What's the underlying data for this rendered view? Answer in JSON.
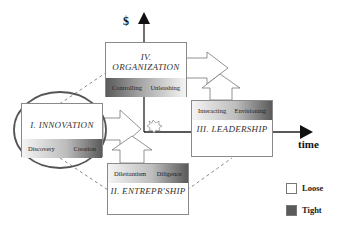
{
  "axes": {
    "y_label": "$",
    "x_label": "time"
  },
  "quadrants": [
    {
      "id": "I",
      "title": "I. INNOVATION",
      "left": "Discovery",
      "right": "Creation"
    },
    {
      "id": "II",
      "title": "II. ENTREPR'SHIP",
      "left": "Dilettantism",
      "right": "Diligence"
    },
    {
      "id": "III",
      "title": "III. LEADERSHIP",
      "left": "Interacting",
      "right": "Envisioning"
    },
    {
      "id": "IV",
      "title": "IV. ORGANIZATION",
      "left": "Controlling",
      "right": "Unleashing"
    }
  ],
  "legend": [
    {
      "label": "Loose",
      "color": "#ffffff"
    },
    {
      "label": "Tight",
      "color": "#5a5a5a"
    }
  ]
}
